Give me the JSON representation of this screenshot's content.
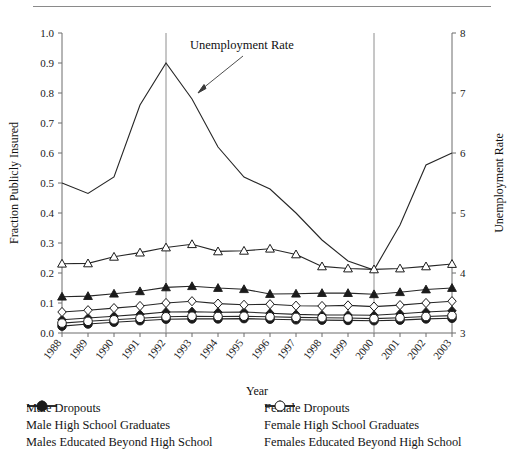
{
  "figure": {
    "header_faint_text": "",
    "annotation": {
      "label": "Unemployment Rate"
    }
  },
  "axes": {
    "x_title": "Year",
    "y_left_title": "Fraction Publicly Insured",
    "y_right_title": "Unemployment Rate",
    "x_ticklabels": [
      "1988",
      "1989",
      "1990",
      "1991",
      "1992",
      "1993",
      "1994",
      "1995",
      "1996",
      "1997",
      "1998",
      "1999",
      "2000",
      "2001",
      "2002",
      "2003"
    ],
    "y_left_ticklabels": [
      "1.0",
      "0.9",
      "0.8",
      "0.7",
      "0.6",
      "0.5",
      "0.4",
      "0.3",
      "0.2",
      "0.1",
      "0.0"
    ],
    "y_right_ticklabels": [
      "8",
      "7",
      "6",
      "5",
      "4",
      "3"
    ]
  },
  "legend": {
    "left_column": [
      {
        "label": "Male Dropouts",
        "marker": "triangle-filled"
      },
      {
        "label": "Male High School Graduates",
        "marker": "diamond-filled"
      },
      {
        "label": "Males Educated Beyond High School",
        "marker": "circle-filled"
      }
    ],
    "right_column": [
      {
        "label": "Female Dropouts",
        "marker": "triangle-open"
      },
      {
        "label": "Female High School Graduates",
        "marker": "diamond-open"
      },
      {
        "label": "Females Educated Beyond High School",
        "marker": "circle-open"
      }
    ]
  },
  "chart_data": {
    "type": "line",
    "title": "",
    "xlabel": "Year",
    "ylabel": "Fraction Publicly Insured",
    "y2label": "Unemployment Rate",
    "x": [
      1988,
      1989,
      1990,
      1991,
      1992,
      1993,
      1994,
      1995,
      1996,
      1997,
      1998,
      1999,
      2000,
      2001,
      2002,
      2003
    ],
    "categories": [
      "1988",
      "1989",
      "1990",
      "1991",
      "1992",
      "1993",
      "1994",
      "1995",
      "1996",
      "1997",
      "1998",
      "1999",
      "2000",
      "2001",
      "2002",
      "2003"
    ],
    "ylim": [
      0.0,
      1.0
    ],
    "y2lim": [
      3,
      8
    ],
    "grid": false,
    "legend_position": "below",
    "reference_lines": [
      1992,
      2000
    ],
    "annotations": [
      {
        "text": "Unemployment Rate",
        "points_to_year": 1993,
        "points_to_value": 0.8
      }
    ],
    "series": [
      {
        "name": "Unemployment Rate",
        "axis": "right",
        "marker": "none",
        "values_right_axis": [
          5.5,
          5.3,
          5.6,
          6.8,
          7.5,
          6.9,
          6.1,
          5.6,
          5.4,
          4.9,
          4.5,
          4.2,
          4.0,
          4.8,
          5.8,
          6.0
        ],
        "values_left_scale": [
          0.5,
          0.465,
          0.52,
          0.76,
          0.9,
          0.78,
          0.62,
          0.52,
          0.48,
          0.4,
          0.31,
          0.24,
          0.21,
          0.36,
          0.56,
          0.6
        ]
      },
      {
        "name": "Male Dropouts",
        "axis": "left",
        "marker": "triangle-filled",
        "values": [
          0.121,
          0.123,
          0.131,
          0.139,
          0.152,
          0.156,
          0.15,
          0.146,
          0.13,
          0.131,
          0.133,
          0.133,
          0.129,
          0.136,
          0.145,
          0.15
        ]
      },
      {
        "name": "Female Dropouts",
        "axis": "left",
        "marker": "triangle-open",
        "values": [
          0.231,
          0.232,
          0.254,
          0.268,
          0.285,
          0.296,
          0.272,
          0.274,
          0.281,
          0.262,
          0.222,
          0.215,
          0.212,
          0.215,
          0.222,
          0.23
        ]
      },
      {
        "name": "Male High School Graduates",
        "axis": "left",
        "marker": "diamond-filled",
        "values": [
          0.044,
          0.05,
          0.056,
          0.062,
          0.07,
          0.071,
          0.069,
          0.07,
          0.066,
          0.062,
          0.06,
          0.06,
          0.059,
          0.064,
          0.07,
          0.074
        ]
      },
      {
        "name": "Female High School Graduates",
        "axis": "left",
        "marker": "diamond-open",
        "values": [
          0.07,
          0.076,
          0.083,
          0.09,
          0.1,
          0.106,
          0.098,
          0.094,
          0.096,
          0.091,
          0.09,
          0.092,
          0.088,
          0.093,
          0.1,
          0.106
        ]
      },
      {
        "name": "Males Educated Beyond High School",
        "axis": "left",
        "marker": "circle-filled",
        "values": [
          0.023,
          0.03,
          0.036,
          0.041,
          0.046,
          0.047,
          0.047,
          0.048,
          0.046,
          0.044,
          0.043,
          0.042,
          0.041,
          0.043,
          0.047,
          0.049
        ]
      },
      {
        "name": "Females Educated Beyond High School",
        "axis": "left",
        "marker": "circle-open",
        "values": [
          0.033,
          0.039,
          0.044,
          0.049,
          0.054,
          0.056,
          0.055,
          0.056,
          0.054,
          0.052,
          0.051,
          0.05,
          0.048,
          0.051,
          0.055,
          0.058
        ]
      }
    ]
  }
}
